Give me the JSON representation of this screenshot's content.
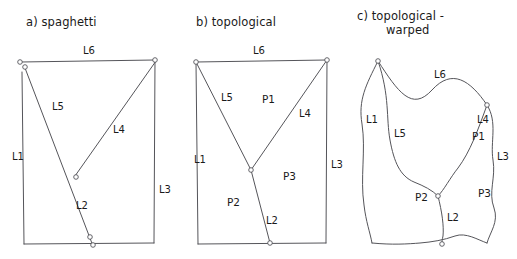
{
  "figure": {
    "caption_note": "",
    "stroke_color": "#55555a",
    "text_color": "#1a1a1a",
    "background": "#ffffff"
  },
  "panels": [
    {
      "id": "a",
      "title": "a) spaghetti",
      "title_line2": "",
      "edge_labels": [
        {
          "text": "L6",
          "x": 83,
          "y": 54
        },
        {
          "text": "L5",
          "x": 52,
          "y": 110
        },
        {
          "text": "L4",
          "x": 113,
          "y": 133
        },
        {
          "text": "L1",
          "x": 12,
          "y": 160
        },
        {
          "text": "L3",
          "x": 159,
          "y": 193
        },
        {
          "text": "L2",
          "x": 76,
          "y": 209
        }
      ],
      "polygon_labels": []
    },
    {
      "id": "b",
      "title": "b) topological",
      "title_line2": "",
      "edge_labels": [
        {
          "text": "L6",
          "x": 253,
          "y": 54
        },
        {
          "text": "L5",
          "x": 221,
          "y": 101
        },
        {
          "text": "L4",
          "x": 299,
          "y": 117
        },
        {
          "text": "L1",
          "x": 194,
          "y": 163
        },
        {
          "text": "L3",
          "x": 331,
          "y": 168
        },
        {
          "text": "L2",
          "x": 266,
          "y": 224
        }
      ],
      "polygon_labels": [
        {
          "text": "P1",
          "x": 262,
          "y": 103
        },
        {
          "text": "P3",
          "x": 283,
          "y": 180
        },
        {
          "text": "P2",
          "x": 227,
          "y": 206
        }
      ]
    },
    {
      "id": "c",
      "title": "c) topological -",
      "title_line2": "warped",
      "edge_labels": [
        {
          "text": "L6",
          "x": 434,
          "y": 78
        },
        {
          "text": "L1",
          "x": 366,
          "y": 123
        },
        {
          "text": "L5",
          "x": 394,
          "y": 137
        },
        {
          "text": "L4",
          "x": 477,
          "y": 123
        },
        {
          "text": "L3",
          "x": 497,
          "y": 160
        },
        {
          "text": "L2",
          "x": 447,
          "y": 221
        }
      ],
      "polygon_labels": [
        {
          "text": "P1",
          "x": 472,
          "y": 140
        },
        {
          "text": "P3",
          "x": 478,
          "y": 197
        },
        {
          "text": "P2",
          "x": 415,
          "y": 201
        }
      ]
    }
  ],
  "geometry": {
    "panel_a": {
      "note": "lines overshoot and do not share nodes",
      "edges": [
        {
          "name": "L6",
          "d": "M 21 62 L 155 60"
        },
        {
          "name": "L1",
          "d": "M 22 72 L 24 244"
        },
        {
          "name": "L3",
          "d": "M 155 60 L 154 243"
        },
        {
          "name": "bottom",
          "d": "M 24 244 L 154 243"
        },
        {
          "name": "L5-L2",
          "d": "M 25 68 L 93 246"
        },
        {
          "name": "L4",
          "d": "M 156 61 L 75 176"
        }
      ],
      "nodes": [
        {
          "x": 20,
          "y": 62,
          "r": 2.3
        },
        {
          "x": 25,
          "y": 67,
          "r": 2.3
        },
        {
          "x": 155,
          "y": 60,
          "r": 2.3
        },
        {
          "x": 76,
          "y": 177,
          "r": 2.3
        },
        {
          "x": 90,
          "y": 237,
          "r": 2.3
        },
        {
          "x": 93,
          "y": 245,
          "r": 2.3
        }
      ]
    },
    "panel_b": {
      "note": "clean shared nodes; faces P1 P2 P3",
      "edges": [
        {
          "name": "L6",
          "d": "M 196 62 L 327 60"
        },
        {
          "name": "L1",
          "d": "M 196 62 L 198 244"
        },
        {
          "name": "L3",
          "d": "M 327 60 L 326 243"
        },
        {
          "name": "bottom",
          "d": "M 198 244 L 326 243"
        },
        {
          "name": "L5",
          "d": "M 196 62 L 251 170"
        },
        {
          "name": "L2",
          "d": "M 251 170 L 270 243"
        },
        {
          "name": "L4",
          "d": "M 327 60 L 251 170"
        }
      ],
      "nodes": [
        {
          "x": 196,
          "y": 62,
          "r": 2.3
        },
        {
          "x": 327,
          "y": 60,
          "r": 2.3
        },
        {
          "x": 251,
          "y": 170,
          "r": 2.3
        },
        {
          "x": 270,
          "y": 243,
          "r": 2.3
        }
      ]
    },
    "panel_c": {
      "note": "same topology, warped geometry, curved edges",
      "edges": [
        {
          "name": "L6",
          "d": "M 378 61 C 398 92 412 112 432 90 C 452 68 470 80 487 105"
        },
        {
          "name": "L1",
          "d": "M 378 61 C 366 85 358 100 362 124 C 366 150 360 178 364 205 C 366 222 370 232 372 243"
        },
        {
          "name": "L3",
          "d": "M 487 105 C 498 122 490 142 493 160 C 496 178 488 192 494 208 C 499 222 490 232 487 243"
        },
        {
          "name": "bottom",
          "d": "M 372 243 C 392 245 408 244 420 243 C 432 242 444 240 455 236 C 466 232 478 240 487 243"
        },
        {
          "name": "L5",
          "d": "M 378 61 C 390 96 386 118 390 140 C 394 162 400 176 414 182 C 424 186 432 190 438 196"
        },
        {
          "name": "L2",
          "d": "M 438 196 C 442 212 444 226 443 236 C 442 240 442 242 442 243"
        },
        {
          "name": "L4",
          "d": "M 487 105 C 478 130 470 152 458 168 C 450 178 444 190 438 196"
        }
      ],
      "nodes": [
        {
          "x": 378,
          "y": 61,
          "r": 2.3
        },
        {
          "x": 487,
          "y": 105,
          "r": 2.3
        },
        {
          "x": 438,
          "y": 196,
          "r": 2.3
        },
        {
          "x": 442,
          "y": 244,
          "r": 2.3
        }
      ]
    }
  },
  "titles_positions": {
    "a": {
      "x": 26,
      "y": 26
    },
    "b": {
      "x": 196,
      "y": 26
    },
    "c": {
      "x": 357,
      "y": 20,
      "x2": 386,
      "y2": 34
    }
  }
}
